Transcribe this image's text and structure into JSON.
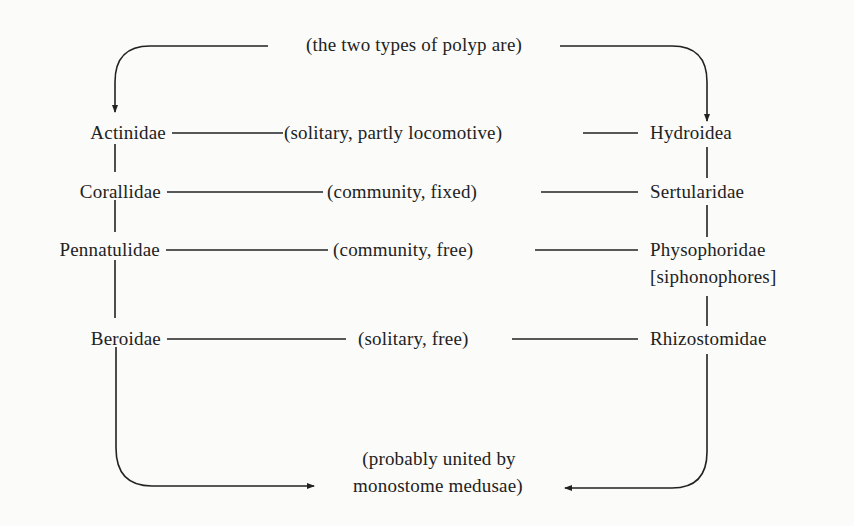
{
  "diagram": {
    "top_caption": "(the two types of polyp are)",
    "bottom_caption_line1": "(probably united by",
    "bottom_caption_line2": "monostome medusae)",
    "colors": {
      "ink": "#222222",
      "background": "#fbfbfa"
    },
    "left_column": [
      {
        "label": "Actinidae"
      },
      {
        "label": "Corallidae"
      },
      {
        "label": "Pennatulidae"
      },
      {
        "label": "Beroidae"
      }
    ],
    "relations": [
      {
        "label": "(solitary, partly locomotive)"
      },
      {
        "label": "(community, fixed)"
      },
      {
        "label": "(community, free)"
      },
      {
        "label": "(solitary, free)"
      }
    ],
    "right_column": [
      {
        "label": "Hydroidea"
      },
      {
        "label": "Sertularidae"
      },
      {
        "label": "Physophoridae",
        "sublabel": "[siphonophores]"
      },
      {
        "label": "Rhizostomidae"
      }
    ]
  }
}
